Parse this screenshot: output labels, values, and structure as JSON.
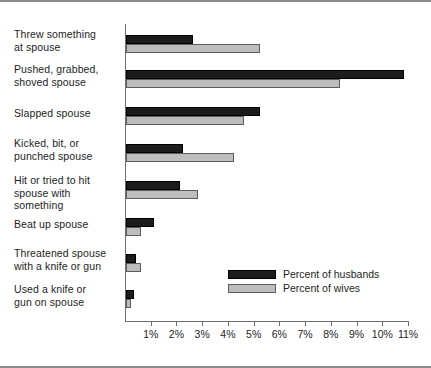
{
  "chart_data": {
    "type": "bar",
    "orientation": "horizontal",
    "title": "",
    "subtitle": "",
    "xlabel": "",
    "ylabel": "",
    "xlim": [
      0,
      11
    ],
    "xtick_labels": [
      "1%",
      "2%",
      "3%",
      "4%",
      "5%",
      "6%",
      "7%",
      "8%",
      "9%",
      "10%",
      "11%"
    ],
    "xtick_values": [
      1,
      2,
      3,
      4,
      5,
      6,
      7,
      8,
      9,
      10,
      11
    ],
    "grid": false,
    "legend_position": "inside-lower-right",
    "categories": [
      "Threw something at spouse",
      "Pushed, grabbed, shoved spouse",
      "Slapped spouse",
      "Kicked, bit, or punched spouse",
      "Hit or tried to hit spouse with something",
      "Beat up spouse",
      "Threatened spouse with a knife or gun",
      "Used a knife or gun on spouse"
    ],
    "category_lines": [
      [
        "Threw something",
        "at spouse"
      ],
      [
        "Pushed, grabbed,",
        "shoved spouse"
      ],
      [
        "Slapped spouse"
      ],
      [
        "Kicked, bit, or",
        "punched spouse"
      ],
      [
        "Hit or tried to hit",
        "spouse with",
        "something"
      ],
      [
        "Beat up spouse"
      ],
      [
        "Threatened spouse",
        "with a knife or gun"
      ],
      [
        "Used a knife or",
        "gun on spouse"
      ]
    ],
    "series": [
      {
        "name": "Percent of husbands",
        "color": "#1c1c1c",
        "values": [
          2.6,
          10.8,
          5.2,
          2.2,
          2.1,
          1.1,
          0.4,
          0.3
        ]
      },
      {
        "name": "Percent of wives",
        "color": "#bdbdbd",
        "values": [
          5.2,
          8.3,
          4.6,
          4.2,
          2.8,
          0.6,
          0.6,
          0.2
        ]
      }
    ]
  },
  "legend": {
    "items": [
      {
        "label": "Percent of husbands",
        "color": "#1c1c1c"
      },
      {
        "label": "Percent of wives",
        "color": "#bdbdbd"
      }
    ]
  },
  "colors": {
    "husbands": "#1c1c1c",
    "wives": "#bdbdbd",
    "axis": "#6e6e6e",
    "frame": "#8c8c8c",
    "text": "#1d1d1d",
    "background": "#ffffff"
  }
}
